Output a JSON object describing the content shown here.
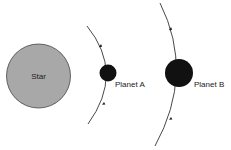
{
  "diagram": {
    "star": {
      "label": "Star",
      "cx": 38.5,
      "cy": 76,
      "r": 32,
      "fill": "#a8a8a8",
      "stroke": "#444444"
    },
    "planets": [
      {
        "name": "planet-a",
        "label": "Planet A",
        "cx": 108,
        "cy": 73,
        "r": 8.5,
        "fill": "#111111"
      },
      {
        "name": "planet-b",
        "label": "Planet B",
        "cx": 179,
        "cy": 73,
        "r": 14,
        "fill": "#111111"
      }
    ],
    "orbits": [
      {
        "name": "orbit-a",
        "direction": "upward",
        "stroke": "#333333"
      },
      {
        "name": "orbit-b",
        "direction": "upward",
        "stroke": "#333333"
      }
    ]
  }
}
